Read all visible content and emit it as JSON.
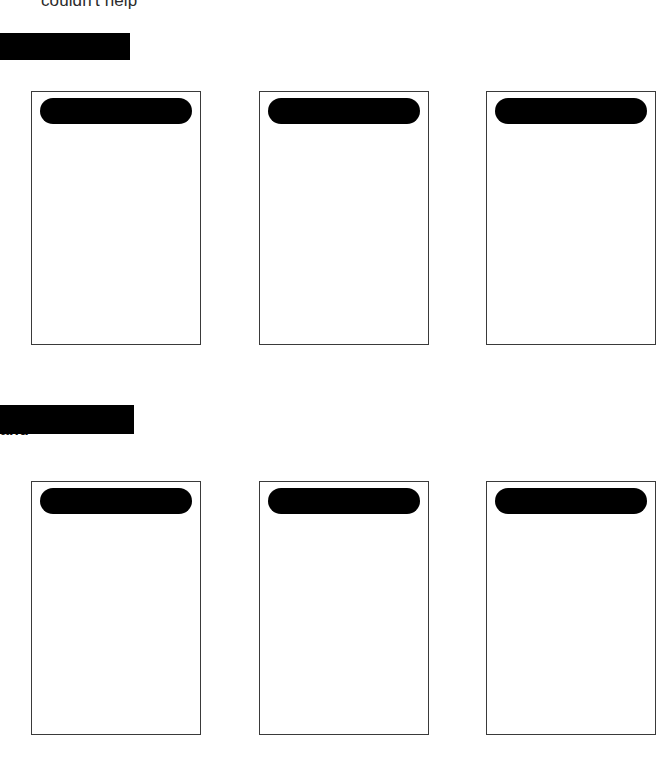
{
  "page": {
    "width": 660,
    "height": 773,
    "background_color": "#ffffff",
    "redaction_color": "#000000",
    "border_color": "#3a3a3a"
  },
  "running_text": {
    "line": "couldn't help"
  },
  "sections": [
    {
      "id": "section-1",
      "heading_text": "st",
      "redaction": {
        "left": 0,
        "top": 33,
        "width": 130,
        "height": 27
      },
      "heading": {
        "left": 0,
        "top": 44
      },
      "cards": [
        {
          "id": "card-1-1",
          "box": {
            "left": 31,
            "top": 91,
            "width": 170,
            "height": 254
          },
          "title_redaction": {
            "left": 8,
            "top": 6,
            "width": 152,
            "height": 26
          }
        },
        {
          "id": "card-1-2",
          "box": {
            "left": 259,
            "top": 91,
            "width": 170,
            "height": 254
          },
          "title_redaction": {
            "left": 8,
            "top": 6,
            "width": 152,
            "height": 26
          }
        },
        {
          "id": "card-1-3",
          "box": {
            "left": 486,
            "top": 91,
            "width": 170,
            "height": 254
          },
          "title_redaction": {
            "left": 8,
            "top": 6,
            "width": 152,
            "height": 26
          }
        }
      ]
    },
    {
      "id": "section-2",
      "heading_text": "and",
      "redaction": {
        "left": 0,
        "top": 405,
        "width": 134,
        "height": 29
      },
      "heading": {
        "left": 0,
        "top": 420
      },
      "cards": [
        {
          "id": "card-2-1",
          "box": {
            "left": 31,
            "top": 481,
            "width": 170,
            "height": 254
          },
          "title_redaction": {
            "left": 8,
            "top": 6,
            "width": 152,
            "height": 26
          }
        },
        {
          "id": "card-2-2",
          "box": {
            "left": 259,
            "top": 481,
            "width": 170,
            "height": 254
          },
          "title_redaction": {
            "left": 8,
            "top": 6,
            "width": 152,
            "height": 26
          }
        },
        {
          "id": "card-2-3",
          "box": {
            "left": 486,
            "top": 481,
            "width": 170,
            "height": 254
          },
          "title_redaction": {
            "left": 8,
            "top": 6,
            "width": 152,
            "height": 26
          }
        }
      ]
    }
  ]
}
